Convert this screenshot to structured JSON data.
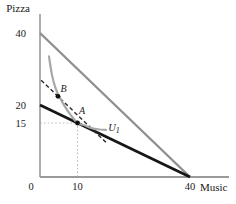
{
  "figure": {
    "y_axis_name": "Pizza",
    "x_axis_name": "Music"
  },
  "chart_data": {
    "type": "line",
    "title": "",
    "xlabel": "Music",
    "ylabel": "Pizza",
    "xlim": [
      0,
      50
    ],
    "ylim": [
      0,
      45
    ],
    "grid": false,
    "legend": "none",
    "x_ticks": [
      {
        "value": 0,
        "label": "0"
      },
      {
        "value": 10,
        "label": "10"
      },
      {
        "value": 40,
        "label": "40"
      }
    ],
    "y_ticks": [
      {
        "value": 40,
        "label": "40"
      },
      {
        "value": 20,
        "label": "20"
      },
      {
        "value": 15,
        "label": "15"
      }
    ],
    "series": [
      {
        "name": "original-budget-line",
        "style": "solid",
        "color": "#8f8f8f",
        "width": 2.4,
        "points": [
          [
            0,
            40
          ],
          [
            40,
            0
          ]
        ]
      },
      {
        "name": "new-budget-line",
        "style": "solid",
        "color": "#161616",
        "width": 2.6,
        "points": [
          [
            0,
            20
          ],
          [
            40,
            0
          ]
        ]
      },
      {
        "name": "compensated-budget-line",
        "style": "dashed",
        "color": "#2a2a2a",
        "width": 1.4,
        "dash": "4,2.6",
        "points": [
          [
            0.3,
            26.9
          ],
          [
            17.6,
            9.6
          ]
        ]
      },
      {
        "name": "indifference-curve",
        "style": "smooth",
        "color": "#a8a8a8",
        "width": 2.2,
        "points": [
          [
            2.4,
            33.5
          ],
          [
            3.2,
            28.3
          ],
          [
            4.2,
            24.5
          ],
          [
            5.3,
            22.0
          ],
          [
            6.6,
            19.6
          ],
          [
            8.2,
            17.2
          ],
          [
            10,
            15.05
          ],
          [
            12,
            14.3
          ],
          [
            14,
            13.5
          ],
          [
            16,
            13.2
          ],
          [
            17.6,
            13.1
          ]
        ]
      }
    ],
    "points": [
      {
        "label": "A",
        "x": 10,
        "y": 15,
        "label_dx": 1.5,
        "label_dy": -9
      },
      {
        "label": "B",
        "x": 4.8,
        "y": 22.4,
        "label_dx": 2.5,
        "label_dy": -4
      }
    ],
    "curve_label": {
      "text": "U",
      "sub": "1",
      "x": 18.2,
      "y": 12.7
    },
    "reference_lines": [
      {
        "name": "ref-horizontal-15",
        "from": [
          0,
          15
        ],
        "to": [
          10,
          15
        ]
      },
      {
        "name": "ref-vertical-10",
        "from": [
          10,
          0
        ],
        "to": [
          10,
          15
        ]
      }
    ],
    "colors": {
      "axis": "#9a9a9a",
      "text": "#1a1a1a",
      "reference": "#b8b8b8",
      "point": "#111111",
      "background": "#ffffff"
    }
  }
}
